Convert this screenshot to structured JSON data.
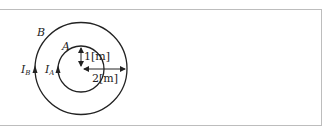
{
  "diagram": {
    "outer_loop": {
      "label": "B",
      "current_label": "I",
      "current_subscript": "B",
      "radius_label": "2[m]"
    },
    "inner_loop": {
      "label": "A",
      "current_label": "I",
      "current_subscript": "A",
      "radius_label": "1[m]"
    },
    "current_direction": "counterclockwise",
    "stroke_color": "#222222"
  }
}
